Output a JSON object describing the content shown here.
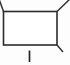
{
  "figure": {
    "canvas": {
      "width": 70,
      "height": 65,
      "background": "#fdfdfd"
    },
    "ink_color": "#2b2b2b",
    "diagonal_color": "#33322f",
    "tick_color": "#242424",
    "face_color": "#ffffff"
  },
  "chart_data": {
    "type": "diagram",
    "title": "",
    "xlabel": "",
    "ylabel": "",
    "shapes": [
      {
        "name": "front-face-rectangle",
        "kind": "rectangle",
        "x": 3.5,
        "y": 11.5,
        "width": 53.5,
        "height": 33.5,
        "stroke": "#2b2b2b",
        "fill": "#ffffff"
      },
      {
        "name": "top-left-diagonal",
        "kind": "line",
        "x1": 3.5,
        "y1": 11.5,
        "x2": -1.0,
        "y2": -1.0,
        "stroke": "#33322f"
      },
      {
        "name": "top-right-diagonal",
        "kind": "line",
        "x1": 57.0,
        "y1": 11.5,
        "x2": 69.5,
        "y2": -0.5,
        "stroke": "#33322f"
      },
      {
        "name": "bottom-right-diagonal",
        "kind": "line",
        "x1": 57.0,
        "y1": 45.0,
        "x2": 63.0,
        "y2": 52.0,
        "stroke": "#33322f"
      },
      {
        "name": "bottom-tick-mark",
        "kind": "line",
        "x1": 29.5,
        "y1": 50.5,
        "x2": 29.5,
        "y2": 62.0,
        "stroke": "#242424"
      }
    ]
  }
}
